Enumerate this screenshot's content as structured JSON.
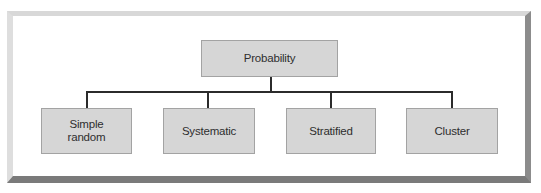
{
  "diagram": {
    "type": "hierarchy",
    "root": {
      "label": "Probability"
    },
    "children": [
      {
        "label": "Simple random"
      },
      {
        "label": "Systematic"
      },
      {
        "label": "Stratified"
      },
      {
        "label": "Cluster"
      }
    ]
  },
  "colors": {
    "node_fill": "#d6d6d6",
    "node_border": "#a3a3a3",
    "connector": "#2b2b2b",
    "text": "#2e2e2e"
  }
}
